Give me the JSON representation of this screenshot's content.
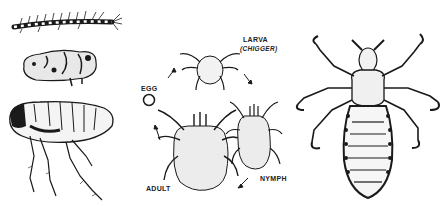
{
  "figure": {
    "panels": [
      {
        "id": "flea-life-stages",
        "stages": [
          "larva",
          "pupa",
          "adult"
        ]
      },
      {
        "id": "chigger-life-cycle",
        "labels": {
          "egg": "EGG",
          "larva": "LARVA",
          "larva_note": "(CHIGGER)",
          "nymph": "NYMPH",
          "adult": "ADULT"
        }
      },
      {
        "id": "louse",
        "stages": [
          "adult"
        ]
      }
    ]
  },
  "colors": {
    "ink": "#1a1a1a",
    "background": "#ffffff",
    "stipple": "#555555"
  }
}
